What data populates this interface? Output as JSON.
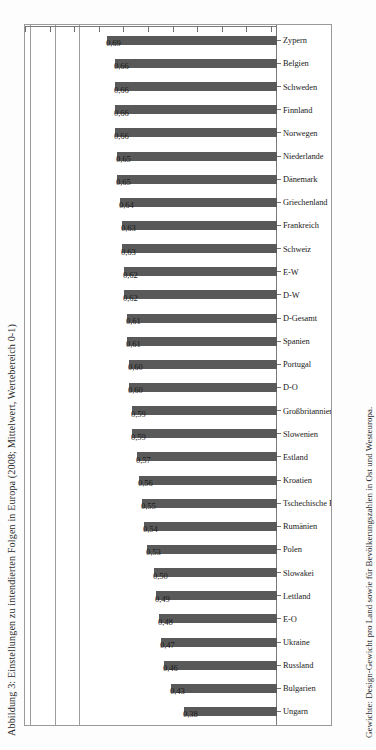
{
  "figure": {
    "title": "Abbildung 3: Einstellungen zu intendierten Folgen in Europa (2008; Mittelwert, Wertebereich 0-1)",
    "caption": "Gewichte: Design-Gewicht pro Land sowie für Bevölkerungszahlen in Ost und Westeuropa."
  },
  "chart_data": {
    "type": "bar",
    "title": "Abbildung 3: Einstellungen zu intendierten Folgen in Europa (2008; Mittelwert, Wertebereich 0-1)",
    "orientation": "vertical-bars-rotated-page",
    "xlabel": "",
    "ylabel": "",
    "ylim": [
      0.0,
      1.0
    ],
    "grid": true,
    "legend": false,
    "tick_labels": [
      "0,00",
      "0,10",
      "0,20",
      "0,30",
      "0,40",
      "0,50",
      "0,60",
      "0,70",
      "0,80",
      "0,90",
      "1,00"
    ],
    "tick_values": [
      0.0,
      0.1,
      0.2,
      0.3,
      0.4,
      0.5,
      0.6,
      0.7,
      0.8,
      0.9,
      1.0
    ],
    "gridline_values": [
      0.8,
      0.9,
      1.0
    ],
    "bar_color": "#595959",
    "categories": [
      "Ungarn",
      "Bulgarien",
      "Russland",
      "Ukraine",
      "E-O",
      "Lettland",
      "Slowakei",
      "Polen",
      "Rumänien",
      "Tschechische Republik",
      "Kroatien",
      "Estland",
      "Slowenien",
      "Großbritannien",
      "D-O",
      "Portugal",
      "Spanien",
      "D-Gesamt",
      "D-W",
      "E-W",
      "Schweiz",
      "Frankreich",
      "Griechenland",
      "Dänemark",
      "Niederlande",
      "Norwegen",
      "Finnland",
      "Schweden",
      "Belgien",
      "Zypern"
    ],
    "values": [
      0.38,
      0.43,
      0.46,
      0.47,
      0.48,
      0.49,
      0.5,
      0.53,
      0.54,
      0.55,
      0.56,
      0.57,
      0.59,
      0.59,
      0.6,
      0.6,
      0.61,
      0.61,
      0.62,
      0.62,
      0.63,
      0.63,
      0.64,
      0.65,
      0.65,
      0.66,
      0.66,
      0.66,
      0.66,
      0.69
    ],
    "value_labels": [
      "0,38",
      "0,43",
      "0,46",
      "0,47",
      "0,48",
      "0,49",
      "0,50",
      "0,53",
      "0,54",
      "0,55",
      "0,56",
      "0,57",
      "0,59",
      "0,59",
      "0,60",
      "0,60",
      "0,61",
      "0,61",
      "0,62",
      "0,62",
      "0,63",
      "0,63",
      "0,64",
      "0,65",
      "0,65",
      "0,66",
      "0,66",
      "0,66",
      "0,66",
      "0,69"
    ]
  }
}
